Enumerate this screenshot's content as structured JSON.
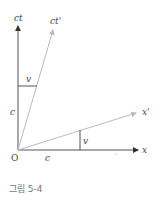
{
  "diagram": {
    "labels": {
      "ct_axis": "ct",
      "ct_prime_axis": "ct'",
      "x_axis": "x",
      "x_prime_axis": "x'",
      "origin": "O",
      "c_vertical": "c",
      "c_horizontal": "c",
      "v_top": "v",
      "v_bottom": "v"
    },
    "colors": {
      "axis": "#555555",
      "primed_axis": "#bbbbbb",
      "segment": "#555555",
      "text": "#444444"
    }
  },
  "caption": "그림 5-4"
}
